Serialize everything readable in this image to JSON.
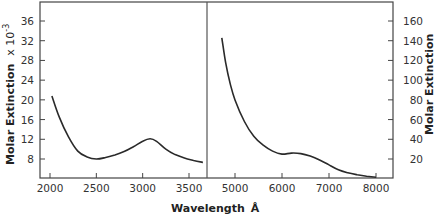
{
  "chart_data": [
    {
      "type": "line",
      "panel": "left",
      "title": "",
      "xlabel": "Wavelength Å",
      "ylabel": "Molar Extinction x 10^-3",
      "xlim": [
        1900,
        3700
      ],
      "ylim": [
        4,
        40
      ],
      "x_ticks": [
        2000,
        2500,
        3000,
        3500
      ],
      "y_ticks": [
        8,
        12,
        16,
        20,
        24,
        28,
        32,
        36
      ],
      "grid": false,
      "series": [
        {
          "name": "UV absorption",
          "x": [
            2020,
            2100,
            2200,
            2300,
            2400,
            2500,
            2600,
            2700,
            2800,
            2900,
            3000,
            3080,
            3150,
            3250,
            3350,
            3450,
            3550,
            3650
          ],
          "y": [
            20.8,
            16.5,
            12.5,
            9.6,
            8.4,
            8.0,
            8.3,
            8.8,
            9.5,
            10.5,
            11.6,
            12.1,
            11.6,
            10.0,
            8.9,
            8.2,
            7.7,
            7.3
          ]
        }
      ]
    },
    {
      "type": "line",
      "panel": "right",
      "title": "",
      "xlabel": "Wavelength Å",
      "ylabel": "Molar Extinction",
      "xlim": [
        4600,
        8300
      ],
      "ylim": [
        0,
        180
      ],
      "x_ticks": [
        5000,
        6000,
        7000,
        8000
      ],
      "y_ticks": [
        20,
        40,
        60,
        80,
        100,
        120,
        140,
        160
      ],
      "grid": false,
      "series": [
        {
          "name": "Visible absorption",
          "x": [
            4720,
            4800,
            4900,
            5000,
            5200,
            5400,
            5600,
            5800,
            6000,
            6200,
            6400,
            6600,
            6800,
            7000,
            7200,
            7400,
            7600,
            7800,
            8000
          ],
          "y": [
            143,
            118,
            96,
            80,
            58,
            43,
            34,
            28,
            25,
            26,
            25.5,
            23,
            19,
            14,
            9,
            6,
            4,
            2.5,
            1.5
          ]
        }
      ]
    }
  ],
  "labels": {
    "left_ylabel": "Molar Extinction",
    "left_ylabel_suffix": "x 10",
    "left_ylabel_exp": "-3",
    "right_ylabel": "Molar Extinction",
    "xlabel": "Wavelength",
    "xlabel_unit": "Å"
  }
}
